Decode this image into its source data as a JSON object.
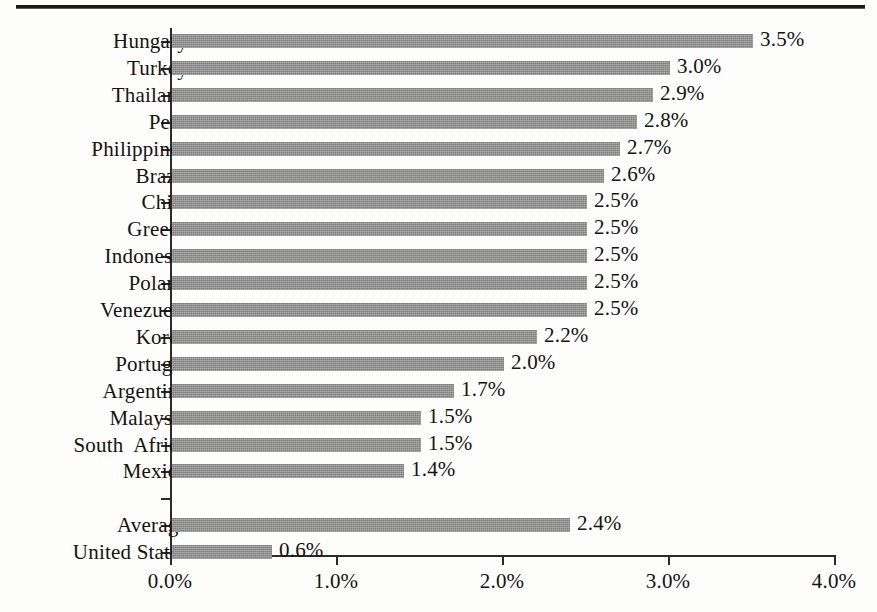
{
  "figure": {
    "top_rule": true,
    "bar_color": "#8c8c8c",
    "axis_color": "#2b2b2b",
    "text_color": "#15130f",
    "background": "#fdfdfc"
  },
  "chart_data": {
    "type": "bar",
    "orientation": "horizontal",
    "title": "",
    "subtitle": "",
    "xlabel": "",
    "ylabel": "",
    "xlim": [
      0.0,
      4.0
    ],
    "xtick_labels": [
      "0.0%",
      "1.0%",
      "2.0%",
      "3.0%",
      "4.0%"
    ],
    "xticks": [
      0.0,
      1.0,
      2.0,
      3.0,
      4.0
    ],
    "grid": false,
    "legend": null,
    "value_label_format": "0.0%",
    "categories": [
      "Hungary",
      "Turkey",
      "Thailand",
      "Peru",
      "Philippines",
      "Brazil",
      "Chile",
      "Greece",
      "Indonesia",
      "Poland",
      "Venezuela",
      "Korea",
      "Portugal",
      "Argentina",
      "Malaysia",
      "South  Africa",
      "Mexico",
      "",
      "Average",
      "United States"
    ],
    "values": [
      3.5,
      3.0,
      2.9,
      2.8,
      2.7,
      2.6,
      2.5,
      2.5,
      2.5,
      2.5,
      2.5,
      2.2,
      2.0,
      1.7,
      1.5,
      1.5,
      1.4,
      null,
      2.4,
      0.6
    ],
    "value_labels": [
      "3.5%",
      "3.0%",
      "2.9%",
      "2.8%",
      "2.7%",
      "2.6%",
      "2.5%",
      "2.5%",
      "2.5%",
      "2.5%",
      "2.5%",
      "2.2%",
      "2.0%",
      "1.7%",
      "1.5%",
      "1.5%",
      "1.4%",
      "",
      "2.4%",
      "0.6%"
    ],
    "spacer_rows": [
      17
    ]
  }
}
